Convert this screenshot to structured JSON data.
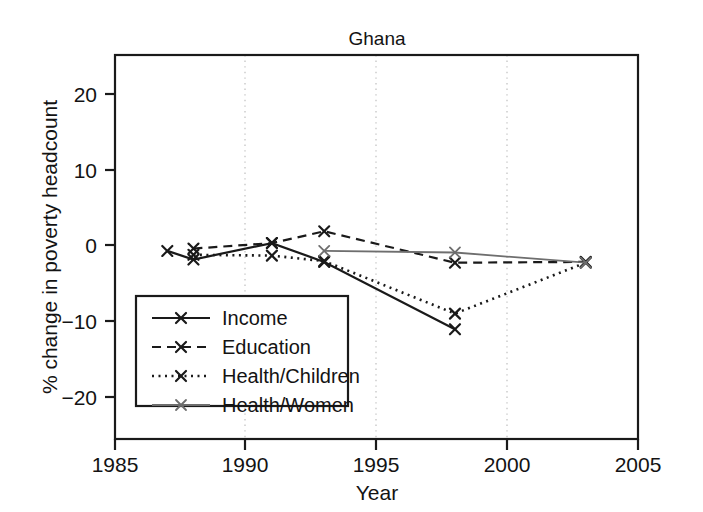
{
  "chart_data": {
    "type": "line",
    "title": "Ghana",
    "xlabel": "Year",
    "ylabel": "% change in poverty headcount",
    "xlim": [
      1985,
      2005
    ],
    "ylim": [
      -24,
      25
    ],
    "xticks": [
      1985,
      1990,
      1995,
      2000,
      2005
    ],
    "xtick_labels": [
      "1985",
      "1990",
      "1995",
      "2000",
      "2005"
    ],
    "yticks": [
      20,
      10,
      0,
      -10,
      -20
    ],
    "ytick_labels": [
      "20",
      "10",
      "0",
      "−10",
      "−20"
    ],
    "grid": "vertical dotted at 1990, 1995, 2000",
    "legend_position": "lower left inside axes",
    "series": [
      {
        "name": "Income",
        "style": "solid",
        "marker": "x",
        "color": "#1a1a1a",
        "x": [
          1987,
          1988,
          1991,
          1993,
          1998
        ],
        "values": [
          0.0,
          -1.1,
          1.0,
          -1.4,
          -10.0
        ]
      },
      {
        "name": "Education",
        "style": "dashed",
        "marker": "x",
        "color": "#1a1a1a",
        "x": [
          1988,
          1991,
          1993,
          1998,
          2003
        ],
        "values": [
          0.3,
          1.0,
          2.5,
          -1.5,
          -1.4
        ]
      },
      {
        "name": "Health/Children",
        "style": "dotted",
        "marker": "x",
        "color": "#1a1a1a",
        "x": [
          1988,
          1991,
          1993,
          1998,
          2003
        ],
        "values": [
          -0.5,
          -0.6,
          -1.3,
          -8.0,
          -1.5
        ]
      },
      {
        "name": "Health/Women",
        "style": "solid-gray",
        "marker": "x",
        "color": "#6e6e6e",
        "x": [
          1993,
          1998,
          2003
        ],
        "values": [
          0.0,
          -0.2,
          -1.5
        ]
      }
    ]
  },
  "legend": {
    "entries": [
      {
        "label": "Income",
        "style": "solid",
        "color": "#1a1a1a"
      },
      {
        "label": "Education",
        "style": "dashed",
        "color": "#1a1a1a"
      },
      {
        "label": "Health/Children",
        "style": "dotted",
        "color": "#1a1a1a"
      },
      {
        "label": "Health/Women",
        "style": "solid-gray",
        "color": "#6e6e6e"
      }
    ]
  }
}
